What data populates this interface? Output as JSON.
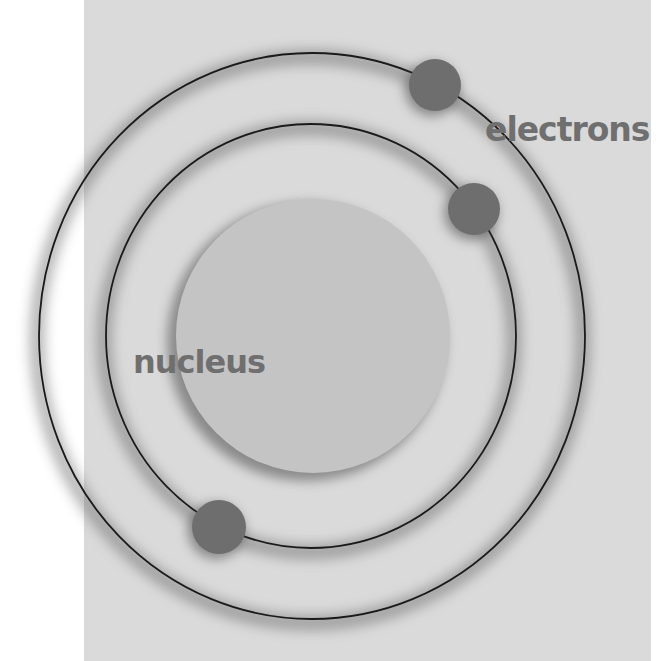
{
  "diagram": {
    "labels": {
      "nucleus": "nucleus",
      "electrons": "electrons"
    },
    "colors": {
      "background_panel": "#dadada",
      "page": "#ffffff",
      "nucleus": "#c4c4c4",
      "electron": "#6e6e6e",
      "orbit_line": "#1a1a1a",
      "label_text": "#6f6f6f"
    },
    "nucleus": {
      "cx": 313,
      "cy": 336,
      "r": 137
    },
    "orbits": [
      {
        "name": "inner",
        "cx": 311,
        "cy": 336,
        "rx": 205,
        "ry": 212
      },
      {
        "name": "outer",
        "cx": 312,
        "cy": 336,
        "rx": 273,
        "ry": 283
      }
    ],
    "electrons": [
      {
        "orbit": "outer",
        "cx": 435,
        "cy": 85,
        "r": 26
      },
      {
        "orbit": "inner",
        "cx": 474,
        "cy": 209,
        "r": 26
      },
      {
        "orbit": "inner",
        "cx": 219,
        "cy": 527,
        "r": 27
      }
    ]
  }
}
